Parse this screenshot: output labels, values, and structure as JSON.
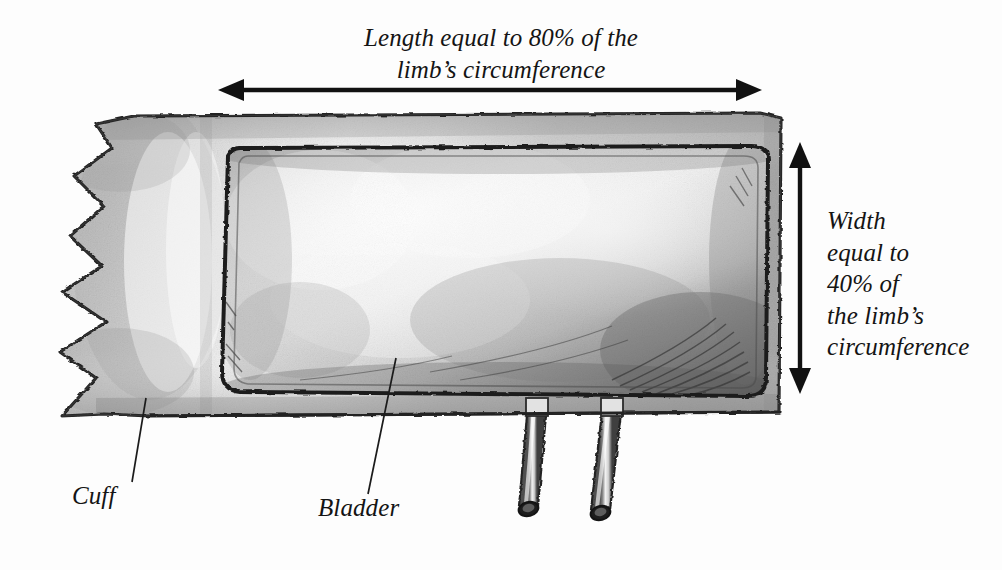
{
  "diagram": {
    "title_implied": "Blood pressure cuff and bladder sizing diagram",
    "labels": {
      "length": {
        "line1": "Length equal to 80% of the",
        "line2": "limb’s circumference"
      },
      "width": {
        "line1": "Width",
        "line2": "equal to",
        "line3": "40% of",
        "line4": "the limb’s",
        "line5": "circumference"
      },
      "cuff": "Cuff",
      "bladder": "Bladder"
    },
    "measurements": {
      "length_percent": "80%",
      "width_percent": "40%",
      "reference": "limb’s circumference"
    },
    "parts": [
      {
        "name": "cuff",
        "label": "Cuff"
      },
      {
        "name": "bladder",
        "label": "Bladder"
      },
      {
        "name": "tube-left",
        "label": ""
      },
      {
        "name": "tube-right",
        "label": ""
      }
    ],
    "colors": {
      "background": "#fdfdfd",
      "ink": "#141414",
      "cuff_fill": "#c9c9c9",
      "cuff_highlight": "#f4f4f4",
      "bladder_fill": "#cccccc",
      "bladder_highlight": "#f7f7f7",
      "bladder_shadow": "#6d6d6d",
      "outline": "#2a2a2a",
      "tube_fill": "#d6d6d6"
    },
    "annotations": {
      "horizontal_arrow": "double-headed horizontal dimension arrow spanning cuff length",
      "vertical_arrow": "double-headed vertical dimension arrow spanning cuff width",
      "cuff_leader": "leader line from cuff body to Cuff label",
      "bladder_leader": "leader line from bladder body to Bladder label"
    }
  }
}
